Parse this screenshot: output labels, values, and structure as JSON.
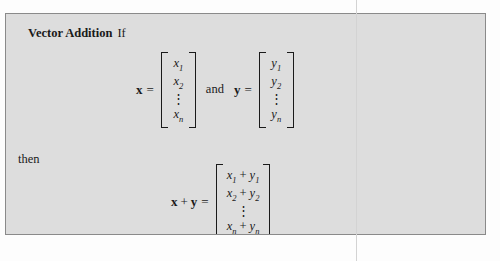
{
  "definition": {
    "term": "Vector Addition",
    "conjunction": "If",
    "then_word": "then",
    "and_word": "and",
    "equals": "=",
    "plus": "+",
    "vdots": "⋮"
  },
  "equation_premise": {
    "x_label": "x",
    "y_label": "y",
    "x_vector": {
      "rows": [
        "x₁",
        "x₂",
        "⋮",
        "xₙ"
      ],
      "entries": [
        {
          "base": "x",
          "sub": "1"
        },
        {
          "base": "x",
          "sub": "2"
        },
        {
          "base": "⋮",
          "sub": ""
        },
        {
          "base": "x",
          "sub": "n"
        }
      ]
    },
    "y_vector": {
      "rows": [
        "y₁",
        "y₂",
        "⋮",
        "yₙ"
      ],
      "entries": [
        {
          "base": "y",
          "sub": "1"
        },
        {
          "base": "y",
          "sub": "2"
        },
        {
          "base": "⋮",
          "sub": ""
        },
        {
          "base": "y",
          "sub": "n"
        }
      ]
    }
  },
  "equation_result": {
    "lhs_left": "x",
    "lhs_right": "y",
    "sum_vector": {
      "rows": [
        "x₁ + y₁",
        "x₂ + y₂",
        "⋮",
        "xₙ + yₙ"
      ],
      "entries": [
        {
          "left_base": "x",
          "left_sub": "1",
          "right_base": "y",
          "right_sub": "1"
        },
        {
          "left_base": "x",
          "left_sub": "2",
          "right_base": "y",
          "right_sub": "2"
        },
        {
          "left_base": "⋮",
          "left_sub": "",
          "right_base": "",
          "right_sub": ""
        },
        {
          "left_base": "x",
          "left_sub": "n",
          "right_base": "y",
          "right_sub": "n"
        }
      ]
    }
  },
  "colors": {
    "box_background": "#dddddd",
    "box_border": "#8a8a8a",
    "page_background": "#fdfdfd",
    "text": "#1a1a1a",
    "page_rule": "#d3d3d3"
  }
}
